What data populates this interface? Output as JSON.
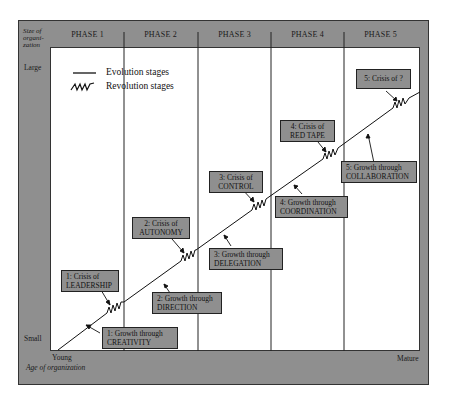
{
  "axes": {
    "y_title": "Size of organization",
    "y_title_lines": [
      "Size of",
      "organi-",
      "zation"
    ],
    "y_top_label": "Large",
    "y_bottom_label": "Small",
    "x_left_label": "Young",
    "x_right_label": "Mature",
    "x_title": "Age of organization"
  },
  "phases": [
    "PHASE 1",
    "PHASE 2",
    "PHASE 3",
    "PHASE 4",
    "PHASE 5"
  ],
  "legend": {
    "evolution": "Evolution stages",
    "revolution": "Revolution stages"
  },
  "growth_stages": [
    {
      "line1": "1: Growth through",
      "line2": "CREATIVITY"
    },
    {
      "line1": "2: Growth through",
      "line2": "DIRECTION"
    },
    {
      "line1": "3: Growth through",
      "line2": "DELEGATION"
    },
    {
      "line1": "4: Growth through",
      "line2": "COORDINATION"
    },
    {
      "line1": "5: Growth through",
      "line2": "COLLABORATION"
    }
  ],
  "crises": [
    {
      "line1": "1: Crisis of",
      "line2": "LEADERSHIP"
    },
    {
      "line1": "2: Crisis of",
      "line2": "AUTONOMY"
    },
    {
      "line1": "3: Crisis of",
      "line2": "CONTROL"
    },
    {
      "line1": "4: Crisis of",
      "line2": "RED TAPE"
    },
    {
      "line1": "5: Crisis of ?",
      "line2": ""
    }
  ],
  "colors": {
    "frame_gray": "#8f8f8f",
    "line": "#111111",
    "plot_bg": "#ffffff"
  }
}
